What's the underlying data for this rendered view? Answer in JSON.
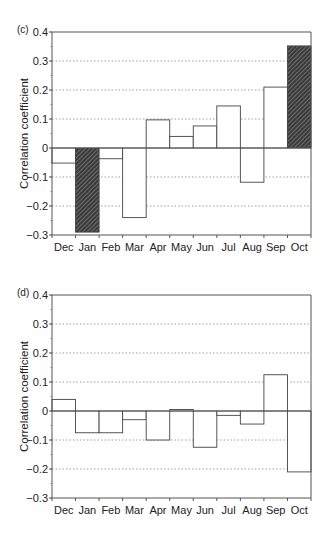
{
  "chart_data": [
    {
      "type": "bar",
      "panel_label": "(c)",
      "title": "",
      "xlabel": "",
      "ylabel": "Correlation coefficient",
      "ylim": [
        -0.3,
        0.4
      ],
      "yticks": [
        0.4,
        0.3,
        0.2,
        0.1,
        0,
        -0.1,
        -0.2,
        -0.3
      ],
      "ytick_labels": [
        "0.4",
        "0.3",
        "0.2",
        "0.1",
        "0",
        "−0.1",
        "−0.2",
        "−0.3"
      ],
      "grid": "dotted horizontal at major ticks",
      "categories": [
        "Dec",
        "Jan",
        "Feb",
        "Mar",
        "Apr",
        "May",
        "Jun",
        "Jul",
        "Aug",
        "Sep",
        "Oct"
      ],
      "values": [
        -0.052,
        -0.29,
        -0.037,
        -0.24,
        0.097,
        0.04,
        0.076,
        0.145,
        -0.118,
        0.21,
        0.352
      ],
      "highlighted": [
        false,
        true,
        false,
        false,
        false,
        false,
        false,
        false,
        false,
        false,
        true
      ],
      "highlight_style": "hatched dark fill (significant)"
    },
    {
      "type": "bar",
      "panel_label": "(d)",
      "title": "",
      "xlabel": "",
      "ylabel": "Correlation coefficient",
      "ylim": [
        -0.3,
        0.4
      ],
      "yticks": [
        0.4,
        0.3,
        0.2,
        0.1,
        0,
        -0.1,
        -0.2,
        -0.3
      ],
      "ytick_labels": [
        "0.4",
        "0.3",
        "0.2",
        "0.1",
        "0",
        "−0.1",
        "−0.2",
        "−0.3"
      ],
      "grid": "dotted horizontal at major ticks",
      "categories": [
        "Dec",
        "Jan",
        "Feb",
        "Mar",
        "Apr",
        "May",
        "Jun",
        "Jul",
        "Aug",
        "Sep",
        "Oct"
      ],
      "values": [
        0.04,
        -0.075,
        -0.075,
        -0.03,
        -0.1,
        0.005,
        -0.125,
        -0.015,
        -0.045,
        0.125,
        -0.21
      ],
      "highlighted": [
        false,
        false,
        false,
        false,
        false,
        false,
        false,
        false,
        false,
        false,
        false
      ],
      "highlight_style": "hatched dark fill (significant)"
    }
  ],
  "colors": {
    "axis": "#555555",
    "bar_edge": "#444444",
    "grid": "#888888",
    "hatch_bg": "#3a3a3a",
    "hatch_line": "#bbbbbb"
  }
}
